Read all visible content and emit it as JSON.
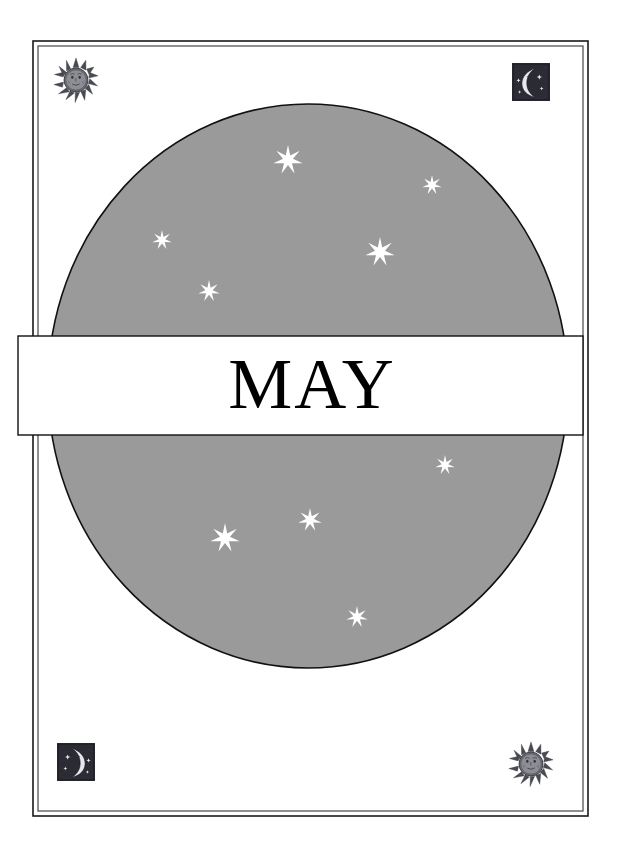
{
  "page": {
    "title": "MAY",
    "background_color": "#ffffff",
    "width": 624,
    "height": 849
  },
  "frame": {
    "name": "double-rule-border",
    "outer_color": "#1a1a1a",
    "inner_color": "#555555",
    "outer_rect": {
      "x": 33,
      "y": 41,
      "width": 555,
      "height": 775
    },
    "inner_rect": {
      "x": 38,
      "y": 46,
      "width": 545,
      "height": 765
    }
  },
  "ornaments": [
    {
      "name": "sun-face-icon",
      "position": "top-left",
      "cx": 76,
      "cy": 80,
      "size": 46,
      "kind": "sun"
    },
    {
      "name": "moon-face-icon",
      "position": "top-right",
      "cx": 531,
      "cy": 82,
      "size": 38,
      "kind": "moon"
    },
    {
      "name": "moon-face-icon",
      "position": "bottom-left",
      "cx": 76,
      "cy": 762,
      "size": 38,
      "kind": "moon"
    },
    {
      "name": "sun-face-icon",
      "position": "bottom-right",
      "cx": 531,
      "cy": 764,
      "size": 46,
      "kind": "sun"
    }
  ],
  "night_sky": {
    "name": "night-sky-circle",
    "fill_color": "#9a9a9a",
    "outline_color": "#111111",
    "cx": 308,
    "cy": 386,
    "rx": 260,
    "ry": 282,
    "stars": [
      {
        "cx": 288,
        "cy": 160,
        "r": 15,
        "points": 7
      },
      {
        "cx": 432,
        "cy": 185,
        "r": 10,
        "points": 7
      },
      {
        "cx": 162,
        "cy": 240,
        "r": 10,
        "points": 7
      },
      {
        "cx": 380,
        "cy": 252,
        "r": 15,
        "points": 7
      },
      {
        "cx": 209,
        "cy": 291,
        "r": 11,
        "points": 7
      },
      {
        "cx": 445,
        "cy": 465,
        "r": 10,
        "points": 7
      },
      {
        "cx": 310,
        "cy": 520,
        "r": 12,
        "points": 7
      },
      {
        "cx": 225,
        "cy": 538,
        "r": 15,
        "points": 7
      },
      {
        "cx": 357,
        "cy": 617,
        "r": 11,
        "points": 7
      }
    ],
    "star_color": "#ffffff"
  },
  "title_band": {
    "name": "month-title-band",
    "label": "MAY",
    "x": 18,
    "y": 336,
    "width": 565,
    "height": 99,
    "fill_color": "#ffffff",
    "border_color": "#111111",
    "text_color": "#000000"
  }
}
